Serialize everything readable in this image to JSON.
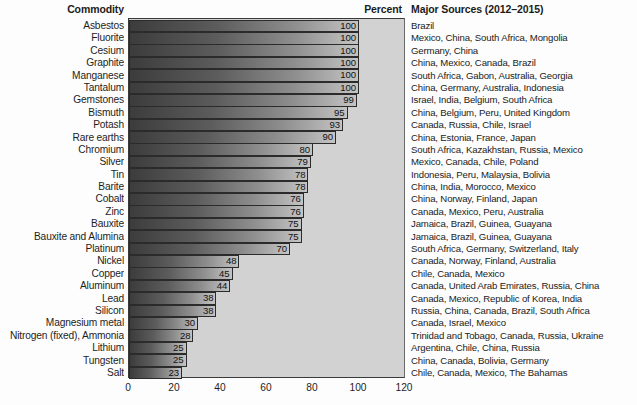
{
  "header": {
    "commodity": "Commodity",
    "percent": "Percent",
    "sources": "Major Sources (2012–2015)"
  },
  "chart_data": {
    "type": "bar",
    "orientation": "horizontal",
    "title": "",
    "xlabel": "Percent",
    "ylabel": "Commodity",
    "xlim": [
      0,
      120
    ],
    "xticks": [
      0,
      20,
      40,
      60,
      80,
      100,
      120
    ],
    "grid": false,
    "legend": null,
    "categories": [
      "Asbestos",
      "Fluorite",
      "Cesium",
      "Graphite",
      "Manganese",
      "Tantalum",
      "Gemstones",
      "Bismuth",
      "Potash",
      "Rare earths",
      "Chromium",
      "Silver",
      "Tin",
      "Barite",
      "Cobalt",
      "Zinc",
      "Bauxite",
      "Bauxite and Alumina",
      "Platinum",
      "Nickel",
      "Copper",
      "Aluminum",
      "Lead",
      "Silicon",
      "Magnesium metal",
      "Nitrogen (fixed), Ammonia",
      "Lithium",
      "Tungsten",
      "Salt"
    ],
    "values": [
      100,
      100,
      100,
      100,
      100,
      100,
      99,
      95,
      93,
      90,
      80,
      79,
      78,
      78,
      76,
      76,
      75,
      75,
      70,
      48,
      45,
      44,
      38,
      38,
      30,
      28,
      25,
      25,
      23
    ],
    "sources": [
      "Brazil",
      "Mexico, China, South Africa, Mongolia",
      "Germany, China",
      "China, Mexico, Canada, Brazil",
      "South Africa, Gabon, Australia, Georgia",
      "China, Germany, Australia, Indonesia",
      "Israel, India, Belgium, South Africa",
      "China, Belgium, Peru, United Kingdom",
      "Canada, Russia, Chile, Israel",
      "China, Estonia, France, Japan",
      "South Africa, Kazakhstan, Russia, Mexico",
      "Mexico, Canada, Chile, Poland",
      "Indonesia, Peru, Malaysia, Bolivia",
      "China, India, Morocco, Mexico",
      "China, Norway, Finland, Japan",
      "Canada, Mexico, Peru, Australia",
      "Jamaica, Brazil, Guinea, Guayana",
      "Jamaica, Brazil, Guinea, Guayana",
      "South Africa, Germany, Switzerland, Italy",
      "Canada, Norway, Finland, Australia",
      "Chile, Canada, Mexico",
      "Canada, United Arab Emirates, Russia, China",
      "Canada, Mexico, Republic of Korea, India",
      "Russia, China, Canada, Brazil, South Africa",
      "Canada, Israel, Mexico",
      "Trinidad and Tobago, Canada, Russia, Ukraine",
      "Argentina, Chile, China, Russia",
      "China, Canada, Bolivia, Germany",
      "Chile, Canada, Mexico, The Bahamas"
    ]
  },
  "colors": {
    "plot_background": "#d2d2d2",
    "bar_dark": "#3c3c3c",
    "bar_light": "#c4c4c4",
    "text": "#1d1d1d",
    "page_background": "#fdfdfd"
  }
}
